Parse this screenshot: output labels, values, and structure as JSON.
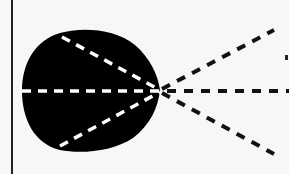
{
  "diagram": {
    "colors": {
      "background": "#f7f7f7",
      "blob": "#000000",
      "inner_dashes": "#ffffff",
      "outer_dashes": "#111111",
      "border_line": "#222222"
    },
    "focal_point": {
      "x": 160,
      "y": 90
    },
    "inner_rays": [
      {
        "from": [
          62,
          37
        ]
      },
      {
        "from": [
          22,
          91
        ]
      },
      {
        "from": [
          60,
          146
        ]
      }
    ],
    "outer_rays": [
      {
        "to": [
          274,
          30
        ]
      },
      {
        "to": [
          289,
          91
        ]
      },
      {
        "to": [
          274,
          154
        ]
      }
    ]
  }
}
